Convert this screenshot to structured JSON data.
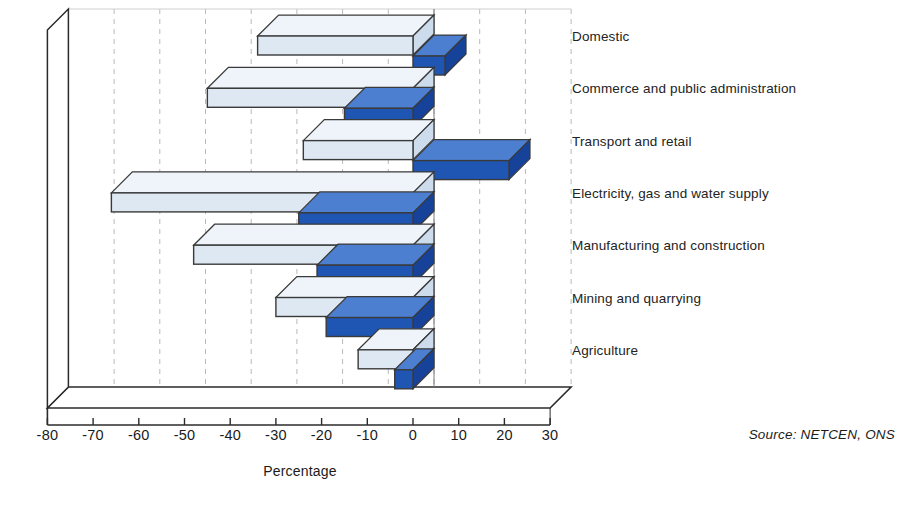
{
  "chart_data": {
    "type": "bar",
    "orientation": "horizontal",
    "style": "3d-grouped-horizontal-bar",
    "title": "",
    "xlabel": "Percentage",
    "ylabel": "",
    "xlim": [
      -80,
      30
    ],
    "xticks": [
      -80,
      -70,
      -60,
      -50,
      -40,
      -30,
      -20,
      -10,
      0,
      10,
      20,
      30
    ],
    "xtick_labels": [
      "-80",
      "-70",
      "-60",
      "-50",
      "-40",
      "-30",
      "-20",
      "-10",
      "0",
      "10",
      "20",
      "30"
    ],
    "grid": "vertical-dashed",
    "legend": "none",
    "categories": [
      "Domestic",
      " Commerce and public administration",
      "Transport and retail",
      "Electricity, gas and water supply",
      "Manufacturing and construction",
      "Mining and quarrying",
      "Agriculture"
    ],
    "series": [
      {
        "name": "series-back",
        "color": "#dde8f3",
        "values": [
          -34,
          -45,
          -24,
          -66,
          -48,
          -30,
          -12
        ]
      },
      {
        "name": "series-front",
        "color": "#1f56b4",
        "values": [
          7,
          -15,
          21,
          -25,
          -21,
          -19,
          -4
        ]
      }
    ],
    "source": "Source:  NETCEN, ONS",
    "colors": {
      "back_bar_face": "#dde8f3",
      "back_bar_top": "#eef4fa",
      "back_bar_side": "#ccdcec",
      "front_bar_face": "#1f56b4",
      "front_bar_top": "#4c7fd0",
      "front_bar_side": "#17429a",
      "outline": "#3a3a3a",
      "gridline": "#b9b9b9",
      "axis": "#2b2b2b",
      "text": "#1b1b1b"
    }
  },
  "axis": {
    "x_title": "Percentage"
  },
  "footer": {
    "source": "Source:  NETCEN, ONS"
  }
}
